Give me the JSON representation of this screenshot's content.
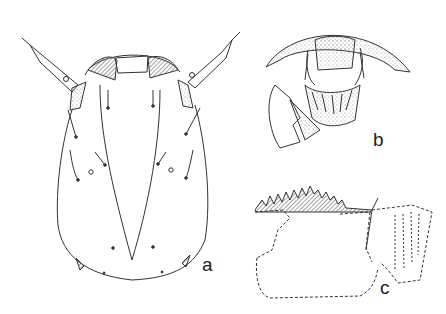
{
  "figure": {
    "panels": [
      {
        "id": "a",
        "label": "a",
        "description": "larval head capsule, dorsal view"
      },
      {
        "id": "b",
        "label": "b",
        "description": "head, frontal view with mouthparts (stippled)"
      },
      {
        "id": "c",
        "label": "c",
        "description": "mentum with toothed margin and ventromental plate (dashed outline)"
      }
    ],
    "colors": {
      "ink": "#333333",
      "stipple": "#bdbdbd",
      "background": "#ffffff"
    }
  }
}
